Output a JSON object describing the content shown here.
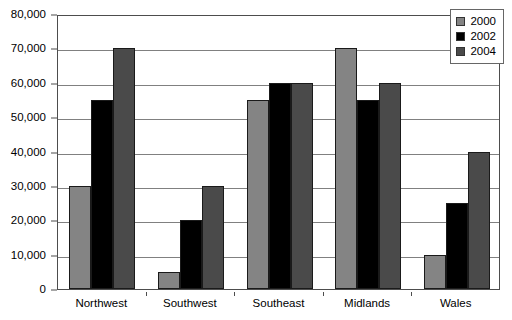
{
  "chart_data": {
    "type": "bar",
    "title": "",
    "subtitle": "",
    "xlabel": "",
    "ylabel": "",
    "categories": [
      "Northwest",
      "Southwest",
      "Southeast",
      "Midlands",
      "Wales"
    ],
    "series": [
      {
        "name": "2000",
        "color": "#848484",
        "values": [
          30000,
          5000,
          55000,
          70000,
          10000
        ]
      },
      {
        "name": "2002",
        "color": "#000000",
        "values": [
          55000,
          20000,
          60000,
          55000,
          25000
        ]
      },
      {
        "name": "2004",
        "color": "#4a4a4a",
        "values": [
          70000,
          30000,
          60000,
          60000,
          40000
        ]
      }
    ],
    "ylim": [
      0,
      80000
    ],
    "ytick_values": [
      0,
      10000,
      20000,
      30000,
      40000,
      50000,
      60000,
      70000,
      80000
    ],
    "ytick_labels": [
      "0",
      "10,000",
      "20,000",
      "30,000",
      "40,000",
      "50,000",
      "60,000",
      "70,000",
      "80,000"
    ],
    "grid": true,
    "grid_axis": "y",
    "legend_position": "top-right",
    "legend_entries": [
      "2000",
      "2002",
      "2004"
    ],
    "annotations": []
  },
  "colors": {
    "background": "#ffffff",
    "axis": "#4d4d4d",
    "gridline": "#808080",
    "bar_outline": "#1a1a1a",
    "legend_border": "#666666"
  }
}
